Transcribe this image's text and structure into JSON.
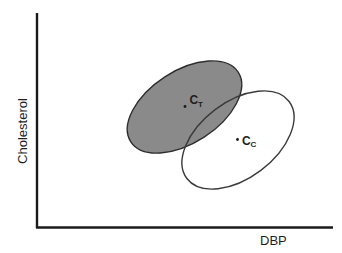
{
  "figure": {
    "type": "bivariate confidence ellipse diagram",
    "x_axis": {
      "label": "DBP"
    },
    "y_axis": {
      "label": "Cholesterol"
    },
    "groups": [
      {
        "id": "treated",
        "centroid_label": "C",
        "centroid_subscript": "T",
        "fill": "#8a8a8a",
        "filled": true
      },
      {
        "id": "control",
        "centroid_label": "C",
        "centroid_subscript": "C",
        "fill": "none",
        "filled": false
      }
    ],
    "colors": {
      "axis": "#1a1a1a",
      "treated_fill": "#8a8a8a",
      "outline": "#2e2e2e",
      "background": "#ffffff"
    }
  }
}
